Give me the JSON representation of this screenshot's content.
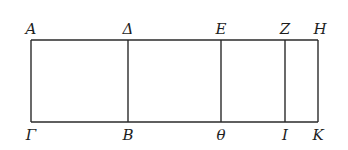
{
  "diagram": {
    "type": "geometric-figure",
    "top_y": 40,
    "bottom_y": 122,
    "stroke_color": "#2a2a2a",
    "points": {
      "A": {
        "label": "A",
        "x": 31,
        "y": 40
      },
      "Delta": {
        "label": "Δ",
        "x": 128,
        "y": 40
      },
      "E": {
        "label": "E",
        "x": 221,
        "y": 40
      },
      "Z": {
        "label": "Z",
        "x": 285,
        "y": 40
      },
      "H": {
        "label": "H",
        "x": 318,
        "y": 40
      },
      "Gamma": {
        "label": "Γ",
        "x": 31,
        "y": 122
      },
      "B": {
        "label": "B",
        "x": 128,
        "y": 122
      },
      "Theta": {
        "label": "θ",
        "x": 221,
        "y": 122
      },
      "I": {
        "label": "I",
        "x": 285,
        "y": 122
      },
      "K": {
        "label": "K",
        "x": 318,
        "y": 122
      }
    },
    "top_labels": [
      {
        "key": "A",
        "text": "A",
        "x": 31
      },
      {
        "key": "Delta",
        "text": "Δ",
        "x": 128
      },
      {
        "key": "E",
        "text": "E",
        "x": 221
      },
      {
        "key": "Z",
        "text": "Z",
        "x": 285
      },
      {
        "key": "H",
        "text": "H",
        "x": 318
      }
    ],
    "bottom_labels": [
      {
        "key": "Gamma",
        "text": "Γ",
        "x": 31
      },
      {
        "key": "B",
        "text": "B",
        "x": 128
      },
      {
        "key": "Theta",
        "text": "θ",
        "x": 221
      },
      {
        "key": "I",
        "text": "I",
        "x": 285
      },
      {
        "key": "K",
        "text": "K",
        "x": 318
      }
    ],
    "segments": [
      {
        "name": "AH",
        "from": "A",
        "to": "H"
      },
      {
        "name": "GammaK",
        "from": "Gamma",
        "to": "K"
      },
      {
        "name": "AGamma",
        "from": "A",
        "to": "Gamma"
      },
      {
        "name": "DeltaB",
        "from": "Delta",
        "to": "B"
      },
      {
        "name": "ETheta",
        "from": "E",
        "to": "Theta"
      },
      {
        "name": "ZI",
        "from": "Z",
        "to": "I"
      },
      {
        "name": "HK",
        "from": "H",
        "to": "K"
      }
    ]
  }
}
